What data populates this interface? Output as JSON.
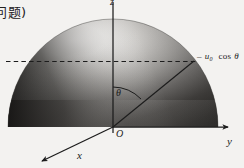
{
  "figure": {
    "kind": "3d-coordinate-hemisphere-diagram",
    "caption_fragment": "问题)",
    "axes": {
      "z_label": "z",
      "y_label": "y",
      "x_label": "x",
      "origin_label": "O"
    },
    "angle_label": "θ",
    "projection_label": {
      "leader": "–",
      "symbol": "u",
      "subscript": "0",
      "expression": "cos",
      "angle": "θ",
      "full": "– u₀ cos θ"
    },
    "elements": {
      "dome_name": "shaded-hemisphere",
      "ray_name": "radius-ray",
      "dashed_name": "projection-dashed-line",
      "arc_name": "theta-arc"
    },
    "colors": {
      "background": "#f3f2f0",
      "ink": "#1c1c1c",
      "dome_light": "#f0efed",
      "dome_mid": "#8f8d8b",
      "dome_dark": "#2a2927"
    }
  }
}
